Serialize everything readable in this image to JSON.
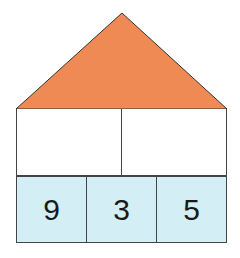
{
  "diagram": {
    "type": "number-house",
    "colors": {
      "roof": "#f08a54",
      "roof_stroke": "#333333",
      "top_cells": "#ffffff",
      "bottom_cells": "#d3eef5",
      "border": "#444444"
    },
    "roof": {
      "label": ""
    },
    "top_row": [
      {
        "value": ""
      },
      {
        "value": ""
      }
    ],
    "bottom_row": [
      {
        "value": "9"
      },
      {
        "value": "3"
      },
      {
        "value": "5"
      }
    ]
  }
}
